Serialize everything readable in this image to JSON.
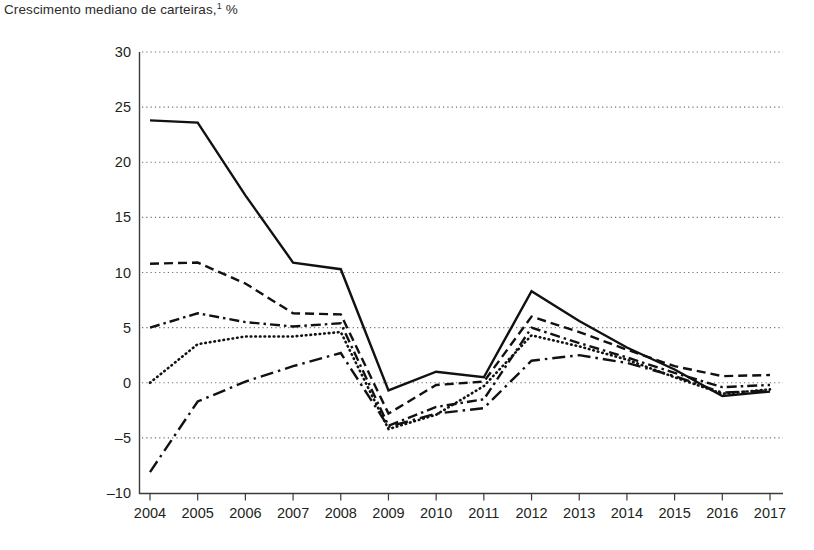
{
  "chart_data": {
    "type": "line",
    "title_text": "Crescimento mediano de carteiras,",
    "title_sup": "1",
    "title_unit": "%",
    "xlabel": "",
    "ylabel": "",
    "grid": true,
    "legend_position": "none",
    "x": [
      2004,
      2005,
      2006,
      2007,
      2008,
      2009,
      2010,
      2011,
      2012,
      2013,
      2014,
      2015,
      2016,
      2017
    ],
    "categories": [
      "2004",
      "2005",
      "2006",
      "2007",
      "2008",
      "2009",
      "2010",
      "2011",
      "2012",
      "2013",
      "2014",
      "2015",
      "2016",
      "2017"
    ],
    "xlim": [
      2004,
      2017
    ],
    "ylim": [
      -10,
      30
    ],
    "yticks": [
      30,
      25,
      20,
      15,
      10,
      5,
      0,
      -5,
      -10
    ],
    "ytick_labels": [
      "30",
      "25",
      "20",
      "15",
      "10",
      "5",
      "0",
      "–5",
      "–10"
    ],
    "series": [
      {
        "name": "series-1",
        "style": "solid",
        "values": [
          23.8,
          23.6,
          17.0,
          10.9,
          10.3,
          -0.7,
          1.0,
          0.5,
          8.3,
          5.6,
          3.2,
          1.2,
          -1.2,
          -0.8
        ]
      },
      {
        "name": "series-2",
        "style": "dashed",
        "values": [
          10.8,
          10.9,
          9.0,
          6.3,
          6.2,
          -2.8,
          -0.2,
          0.1,
          6.0,
          4.6,
          3.0,
          1.5,
          0.6,
          0.7
        ]
      },
      {
        "name": "series-3",
        "style": "dash-dot",
        "values": [
          5.0,
          6.3,
          5.5,
          5.1,
          5.4,
          -3.9,
          -2.2,
          -1.5,
          5.0,
          3.6,
          2.3,
          0.9,
          -0.4,
          -0.2
        ]
      },
      {
        "name": "series-4",
        "style": "dotted",
        "values": [
          0.0,
          3.5,
          4.2,
          4.2,
          4.6,
          -4.2,
          -2.9,
          -0.3,
          4.3,
          3.3,
          2.1,
          0.5,
          -1.0,
          -0.6
        ]
      },
      {
        "name": "series-5",
        "style": "long-dash-dot",
        "values": [
          -8.1,
          -1.7,
          0.1,
          1.5,
          2.7,
          -4.0,
          -2.8,
          -2.3,
          2.0,
          2.5,
          1.8,
          0.6,
          -0.9,
          -0.7
        ]
      }
    ]
  },
  "colors": {
    "line": "#111111",
    "grid": "#6f6f6f",
    "axis": "#3a3a3a",
    "text": "#231f20"
  }
}
